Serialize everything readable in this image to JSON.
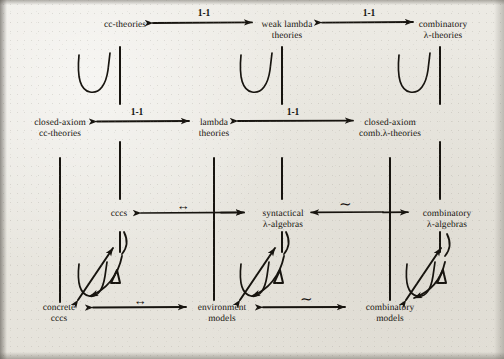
{
  "figure": {
    "kind": "commutative-diagram",
    "background_color": "#eceae4",
    "ink_color": "#17140f",
    "nodes": [
      {
        "id": "cc-theories",
        "line1": "cc-theories",
        "line2": "",
        "x": 125,
        "y": 26
      },
      {
        "id": "weak-lambda-theories",
        "line1": "weak lambda",
        "line2": "theories",
        "x": 287,
        "y": 26
      },
      {
        "id": "combinatory-lambda-theories",
        "line1": "combinatory",
        "line2": "λ-theories",
        "x": 443,
        "y": 26
      },
      {
        "id": "closed-axiom-cc-theories",
        "line1": "closed-axiom",
        "line2": "cc-theories",
        "x": 60,
        "y": 124
      },
      {
        "id": "lambda-theories",
        "line1": "lambda",
        "line2": "theories",
        "x": 214,
        "y": 124
      },
      {
        "id": "closed-axiom-comb-lambda-theories",
        "line1": "closed-axiom",
        "line2": "comb.λ-theories",
        "x": 390,
        "y": 124
      },
      {
        "id": "cccs",
        "line1": "cccs",
        "line2": "",
        "x": 119,
        "y": 215
      },
      {
        "id": "syntactical-lambda-algebras",
        "line1": "syntactical",
        "line2": "λ-algebras",
        "x": 283,
        "y": 215
      },
      {
        "id": "combinatory-lambda-algebras",
        "line1": "combinatory",
        "line2": "λ-algebras",
        "x": 447,
        "y": 215
      },
      {
        "id": "concrete-cccs",
        "line1": "concrete",
        "line2": "cccs",
        "x": 59,
        "y": 310
      },
      {
        "id": "environment-models",
        "line1": "environment",
        "line2": "models",
        "x": 222,
        "y": 310
      },
      {
        "id": "combinatory-models",
        "line1": "combinatory",
        "line2": "models",
        "x": 390,
        "y": 310
      }
    ],
    "arrow_labels": [
      {
        "id": "top-left-1-1",
        "text": "1-1",
        "x": 220,
        "y": 14
      },
      {
        "id": "top-right-1-1",
        "text": "1-1",
        "x": 385,
        "y": 14
      },
      {
        "id": "mid-left-1-1",
        "text": "1-1",
        "x": 134,
        "y": 112
      },
      {
        "id": "mid-right-1-1",
        "text": "1-1",
        "x": 292,
        "y": 112
      },
      {
        "id": "row3-left-bidir",
        "text": "↔",
        "x": 182,
        "y": 203
      },
      {
        "id": "row3-right-tilde",
        "text": "∼",
        "x": 345,
        "y": 202
      },
      {
        "id": "row4-left-bidir",
        "text": "↔",
        "x": 140,
        "y": 297
      },
      {
        "id": "row4-right-tilde",
        "text": "∼",
        "x": 306,
        "y": 297
      }
    ],
    "glyphs": [
      {
        "id": "inclusion-u-1",
        "symbol": "U",
        "x": 93,
        "y": 80
      },
      {
        "id": "inclusion-u-2",
        "symbol": "U",
        "x": 255,
        "y": 80
      },
      {
        "id": "inclusion-u-3",
        "symbol": "U",
        "x": 413,
        "y": 80
      },
      {
        "id": "delta-1",
        "symbol": "△",
        "x": 111,
        "y": 277
      },
      {
        "id": "delta-2",
        "symbol": "△",
        "x": 274,
        "y": 277
      },
      {
        "id": "delta-3",
        "symbol": "△",
        "x": 440,
        "y": 277
      },
      {
        "id": "inclusion-u-4",
        "symbol": "U",
        "x": 88,
        "y": 288
      },
      {
        "id": "inclusion-u-5",
        "symbol": "U",
        "x": 249,
        "y": 288
      },
      {
        "id": "inclusion-u-6",
        "symbol": "U",
        "x": 415,
        "y": 288
      }
    ]
  }
}
